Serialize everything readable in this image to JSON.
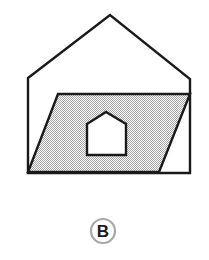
{
  "figure": {
    "option_label": "B",
    "colors": {
      "background": "#ffffff",
      "outline": "#1a1a1a",
      "shading_fill": "#c9c9c9",
      "shading_fill_alt": "#ffffff",
      "inner_house_fill": "#ffffff",
      "label_ring": "#a8a8a8",
      "label_text": "#1a1a1a"
    },
    "shapes": {
      "house_outline": {
        "name": "house-outline",
        "description": "Pentagon house silhouette: square body with gable roof",
        "points": "28,78 110,15 190,79 190,173 28,173"
      },
      "shaded_parallelogram": {
        "name": "shaded-parallelogram",
        "description": "Gray dotted parallelogram slanting left-down across the house body",
        "points": "58,94 190,94 159,172 28,172"
      },
      "inner_house_cutout": {
        "name": "inner-house-cutout",
        "description": "Small white house-shaped hole (pentagon) inside the parallelogram",
        "points": "87,124 106,112 126,124 126,155 87,155"
      }
    },
    "geometry_notes": {
      "roof_apex": "110,15",
      "left_eave": "28,78",
      "right_eave": "190,79",
      "baseline_y": "173",
      "parallelogram_top_y": "94",
      "parallelogram_bottom_y": "172"
    }
  },
  "option_badge": {
    "letter": "B",
    "center_x": "103",
    "center_y": "231",
    "radius": "12"
  }
}
